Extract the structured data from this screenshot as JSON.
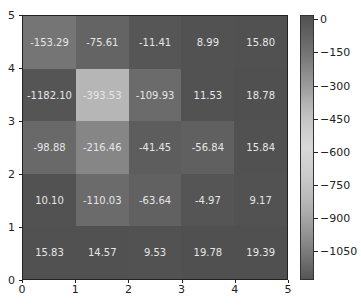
{
  "chart_data": {
    "type": "heatmap",
    "title": "",
    "xlabel": "",
    "ylabel": "",
    "x_ticks": [
      "0",
      "1",
      "2",
      "3",
      "4",
      "5"
    ],
    "y_ticks": [
      "0",
      "1",
      "2",
      "3",
      "4",
      "5"
    ],
    "xlim": [
      0,
      5
    ],
    "ylim": [
      0,
      5
    ],
    "grid": false,
    "rows_top_to_bottom": [
      {
        "y_range": [
          4,
          5
        ],
        "values": [
          -153.29,
          -75.61,
          -11.41,
          8.99,
          15.8
        ],
        "labels": [
          "-153.29",
          "-75.61",
          "-11.41",
          "8.99",
          "15.80"
        ]
      },
      {
        "y_range": [
          3,
          4
        ],
        "values": [
          -1182.1,
          -393.53,
          -109.93,
          11.53,
          18.78
        ],
        "labels": [
          "-1182.10",
          "-393.53",
          "-109.93",
          "11.53",
          "18.78"
        ]
      },
      {
        "y_range": [
          2,
          3
        ],
        "values": [
          -98.88,
          -216.46,
          -41.45,
          -56.84,
          15.84
        ],
        "labels": [
          "-98.88",
          "-216.46",
          "-41.45",
          "-56.84",
          "15.84"
        ]
      },
      {
        "y_range": [
          1,
          2
        ],
        "values": [
          10.1,
          -110.03,
          -63.64,
          -4.97,
          9.17
        ],
        "labels": [
          "10.10",
          "-110.03",
          "-63.64",
          "-4.97",
          "9.17"
        ]
      },
      {
        "y_range": [
          0,
          1
        ],
        "values": [
          15.83,
          14.57,
          9.53,
          19.78,
          19.39
        ],
        "labels": [
          "15.83",
          "14.57",
          "9.53",
          "19.78",
          "19.39"
        ]
      }
    ],
    "colorbar": {
      "ticks": [
        "0",
        "−150",
        "−300",
        "−450",
        "−600",
        "−750",
        "−900",
        "−1050"
      ],
      "tick_values": [
        0,
        -150,
        -300,
        -450,
        -600,
        -750,
        -900,
        -1050
      ],
      "range": [
        -1182.1,
        19.78
      ],
      "position": "right",
      "colormap": "grayscale dark-light-dark"
    }
  }
}
